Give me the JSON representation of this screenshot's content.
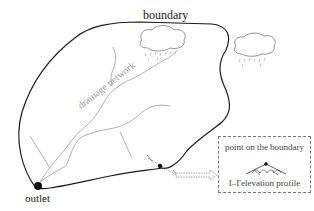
{
  "diagram": {
    "labels": {
      "boundary": "boundary",
      "outlet": "outlet",
      "drainage_network": "drainage network",
      "section_start": "I",
      "section_end": "I'"
    },
    "inset": {
      "title": "point on the boundary",
      "caption": "I–I'elevation profile"
    },
    "elements": [
      {
        "id": "boundary",
        "kind": "closed-curve",
        "description": "watershed boundary"
      },
      {
        "id": "outlet",
        "kind": "point",
        "description": "basin outlet (filled circle)"
      },
      {
        "id": "drainage-network",
        "kind": "branching-lines",
        "description": "river channel network"
      },
      {
        "id": "cloud-inside",
        "kind": "cloud-with-rain",
        "description": "rain cloud over the basin"
      },
      {
        "id": "cloud-outside",
        "kind": "cloud-with-rain",
        "description": "rain cloud outside the basin"
      },
      {
        "id": "boundary-point",
        "kind": "point",
        "description": "point on the boundary with cross-section I–I'"
      },
      {
        "id": "profile-arrow",
        "kind": "hollow-arrow",
        "description": "arrow pointing to elevation profile inset"
      }
    ],
    "colors": {
      "boundary": "#1a1a1a",
      "network": "#9a9a9a",
      "cloud": "#777777",
      "text": "#222222"
    }
  }
}
